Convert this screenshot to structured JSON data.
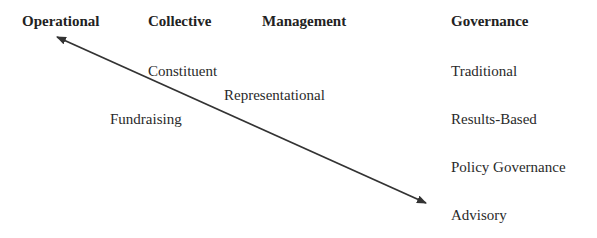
{
  "headers": {
    "operational": "Operational",
    "collective": "Collective",
    "management": "Management",
    "governance": "Governance"
  },
  "middle_labels": {
    "constituent": "Constituent",
    "representational": "Representational",
    "fundraising": "Fundraising"
  },
  "governance_list": [
    "Traditional",
    "Results-Based",
    "Policy Governance",
    "Advisory"
  ],
  "arrow": {
    "type": "double-headed",
    "from": [
      56,
      37
    ],
    "to": [
      427,
      203
    ],
    "color": "#333333"
  }
}
